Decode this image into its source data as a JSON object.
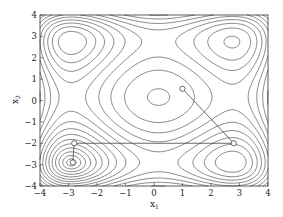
{
  "chart_data": {
    "type": "contour",
    "title": "",
    "xlabel": "x1",
    "ylabel": "x2",
    "xlim": [
      -4,
      4
    ],
    "ylim": [
      -4,
      4
    ],
    "xticks": [
      -4,
      -3,
      -2,
      -1,
      0,
      1,
      2,
      3,
      4
    ],
    "yticks": [
      -4,
      -3,
      -2,
      -1,
      0,
      1,
      2,
      3,
      4
    ],
    "grid": false,
    "legend": null,
    "surface": "Styblinski-Tang-like f(x1,x2) = 0.5*sum(t^4 - 16 t^2 + 5 t)",
    "contour_levels": 16,
    "line_color": "#555555",
    "path": {
      "name": "optimization path",
      "color": "#444444",
      "marker": "open-circle",
      "points": [
        [
          1.0,
          0.55
        ],
        [
          2.8,
          -2.0
        ],
        [
          -2.8,
          -2.0
        ],
        [
          -2.85,
          -2.9
        ]
      ]
    }
  },
  "axes": {
    "xlabel_main": "x",
    "xlabel_sub": "1",
    "ylabel_main": "x",
    "ylabel_sub": "2"
  }
}
